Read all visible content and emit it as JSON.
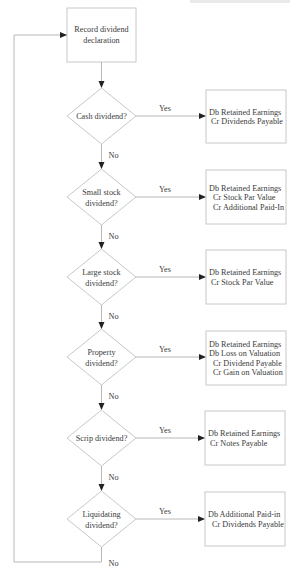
{
  "start": {
    "line1": "Record dividend",
    "line2": "declaration"
  },
  "yes_label": "Yes",
  "no_label": "No",
  "decisions": [
    {
      "lines": [
        "Cash dividend?"
      ],
      "entries": [
        "Db Retained Earnings",
        " Cr Dividends Payable"
      ]
    },
    {
      "lines": [
        "Small stock",
        "dividend?"
      ],
      "entries": [
        "Db Retained Earnings",
        "  Cr Stock Par Value",
        "  Cr Additional Paid-In"
      ]
    },
    {
      "lines": [
        "Large stock",
        "dividend?"
      ],
      "entries": [
        "Db Retained Earnings",
        " Cr Stock Par Value"
      ]
    },
    {
      "lines": [
        "Property",
        "dividend?"
      ],
      "entries": [
        "Db Retained Earnings",
        "Db Loss on Valuation",
        "  Cr Dividend Payable",
        "  Cr Gain on Valuation"
      ]
    },
    {
      "lines": [
        "Scrip dividend?"
      ],
      "entries": [
        "Db Retained Earnings",
        " Cr Notes Payable"
      ]
    },
    {
      "lines": [
        "Liquidating",
        "dividend?"
      ],
      "entries": [
        "Db Additional Paid-in",
        "  Cr Dividends Payable"
      ]
    }
  ],
  "colors": {
    "stroke": "#c8c8c8",
    "arrow": "#222222",
    "text": "#3a3a3a"
  }
}
